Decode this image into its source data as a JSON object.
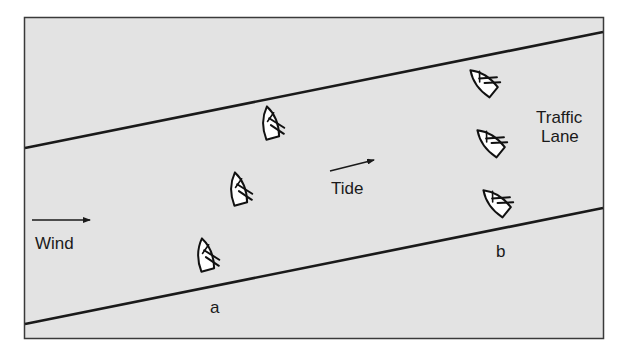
{
  "diagram": {
    "type": "traffic-lane-crossing",
    "background_color": "#e3e3e3",
    "frame_color": "#3a3a3a",
    "line_color": "#1a1a1a",
    "boat_fill": "#ffffff",
    "labels": {
      "wind": "Wind",
      "tide": "Tide",
      "traffic_lane_line1": "Traffic",
      "traffic_lane_line2": "Lane",
      "boat_a": "a",
      "boat_b": "b"
    },
    "arrows": [
      {
        "name": "wind-arrow",
        "from": [
          32,
          220
        ],
        "to": [
          90,
          220
        ]
      },
      {
        "name": "tide-arrow",
        "from": [
          330,
          171
        ],
        "to": [
          374,
          160
        ]
      }
    ],
    "lane_boundaries": [
      {
        "name": "upper-lane-boundary",
        "from": [
          24,
          148
        ],
        "to": [
          604,
          32
        ]
      },
      {
        "name": "lower-lane-boundary",
        "from": [
          24,
          324
        ],
        "to": [
          604,
          208
        ]
      }
    ],
    "boats": [
      {
        "id": "a1",
        "group": "a",
        "x": 270,
        "y": 126,
        "heading": -8
      },
      {
        "id": "a2",
        "group": "a",
        "x": 238,
        "y": 191,
        "heading": -8
      },
      {
        "id": "a3",
        "group": "a",
        "x": 206,
        "y": 258,
        "heading": -8,
        "label": "a"
      },
      {
        "id": "b1",
        "group": "b",
        "x": 484,
        "y": 83,
        "heading": -38
      },
      {
        "id": "b2",
        "group": "b",
        "x": 491,
        "y": 143,
        "heading": -38
      },
      {
        "id": "b3",
        "group": "b",
        "x": 497,
        "y": 203,
        "heading": -38,
        "label": "b"
      }
    ]
  }
}
